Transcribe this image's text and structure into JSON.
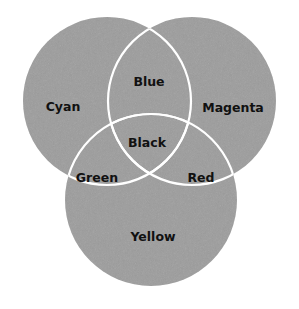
{
  "diagram": {
    "type": "venn",
    "colors": {
      "background": "#ffffff",
      "circle_fill": "#9c9c9c",
      "outline": "#ffffff",
      "label_text": "#111111"
    },
    "circles": [
      {
        "id": "cyan",
        "label": "Cyan",
        "cx": 107,
        "cy": 101,
        "r": 84
      },
      {
        "id": "magenta",
        "label": "Magenta",
        "cx": 192,
        "cy": 101,
        "r": 84
      },
      {
        "id": "yellow",
        "label": "Yellow",
        "cx": 151,
        "cy": 200,
        "r": 86
      }
    ],
    "labels": {
      "cyan": "Cyan",
      "magenta": "Magenta",
      "yellow": "Yellow",
      "blue": "Blue",
      "green": "Green",
      "red": "Red",
      "black": "Black"
    }
  }
}
